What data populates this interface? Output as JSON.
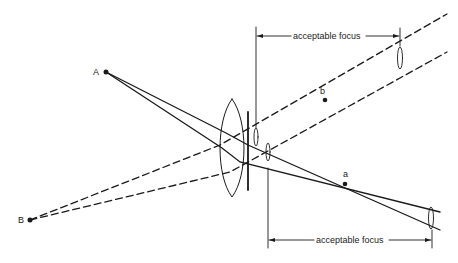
{
  "labels": {
    "point_A": "A",
    "point_B": "B",
    "image_a": "a",
    "image_b": "b",
    "top_dimension": "acceptable focus",
    "bottom_dimension": "acceptable focus"
  },
  "colors": {
    "ink": "#1a1a1a",
    "background": "#ffffff"
  },
  "elements": {
    "object_points": [
      {
        "id": "A",
        "x": 106,
        "y": 72,
        "rays": "solid"
      },
      {
        "id": "B",
        "x": 30,
        "y": 220,
        "rays": "dashed"
      }
    ],
    "image_points": [
      {
        "id": "a",
        "x": 345,
        "y": 184
      },
      {
        "id": "b",
        "x": 325,
        "y": 100
      }
    ],
    "lens": {
      "type": "biconvex",
      "cx": 232,
      "cy": 148
    },
    "aperture_stop": {
      "x": 247
    },
    "dimension_lines": [
      {
        "label": "acceptable focus",
        "y": 36,
        "x_start": 256,
        "x_end": 400,
        "position": "top"
      },
      {
        "label": "acceptable focus",
        "y": 240,
        "x_start": 267,
        "x_end": 432,
        "position": "bottom"
      }
    ]
  }
}
